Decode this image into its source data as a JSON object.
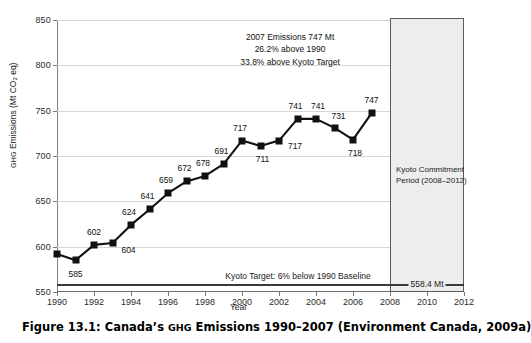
{
  "caption": {
    "prefix": "Figure 13.1:",
    "title_part1": "Canada’s ",
    "title_sc": "GHG",
    "title_part2": " Emissions 1990–2007 (Environment Canada, 2009a)",
    "full": "Figure 13.1:  Canada’s GHG Emissions 1990–2007 (Environment Canada, 2009a)"
  },
  "axis": {
    "y_title_sc": "GHG",
    "y_title_rest": " Emissions (Mt CO",
    "y_title_sub": "2",
    "y_title_tail": " eq)",
    "x_title": "Year"
  },
  "annotation": {
    "line1": "2007 Emissions 747 Mt",
    "line2": "26.2% above 1990",
    "line3": "33.8% above Kyoto Target"
  },
  "kyoto": {
    "band_line1": "Kyoto Commitment",
    "band_line2": "Period (2008–2012)",
    "target_caption": "Kyoto Target: 6% below 1990 Baseline",
    "target_value_label": "558.4 Mt",
    "target_value": 558.4,
    "band_start": 2008,
    "band_end": 2012,
    "band_color": "#ededed",
    "band_border": "#5c5c5c"
  },
  "chart_data": {
    "type": "line",
    "title": "Canada’s GHG Emissions 1990–2007",
    "xlabel": "Year",
    "ylabel": "GHG Emissions (Mt CO2 eq)",
    "xlim": [
      1990,
      2012
    ],
    "ylim": [
      550,
      850
    ],
    "yticks": [
      550,
      600,
      650,
      700,
      750,
      800,
      850
    ],
    "xticks": [
      1990,
      1992,
      1994,
      1996,
      1998,
      2000,
      2002,
      2004,
      2006,
      2008,
      2010,
      2012
    ],
    "grid": "horizontal",
    "legend": "none",
    "marker": "square",
    "series_color": "#111111",
    "x": [
      1990,
      1991,
      1992,
      1993,
      1994,
      1995,
      1996,
      1997,
      1998,
      1999,
      2000,
      2001,
      2002,
      2003,
      2004,
      2005,
      2006,
      2007
    ],
    "values": [
      592,
      585,
      602,
      604,
      624,
      641,
      659,
      672,
      678,
      691,
      717,
      711,
      717,
      741,
      741,
      731,
      718,
      747
    ],
    "point_labels": [
      "",
      "585",
      "602",
      "604",
      "624",
      "641",
      "659",
      "672",
      "678",
      "691",
      "717",
      "711",
      "717",
      "741",
      "741",
      "731",
      "718",
      "747"
    ],
    "reference_lines": [
      {
        "name": "Kyoto Target",
        "y": 558.4,
        "label": "558.4 Mt"
      }
    ],
    "shaded_regions": [
      {
        "name": "Kyoto Commitment Period",
        "x0": 2008,
        "x1": 2012,
        "label": "Kyoto Commitment Period (2008–2012)"
      }
    ]
  }
}
